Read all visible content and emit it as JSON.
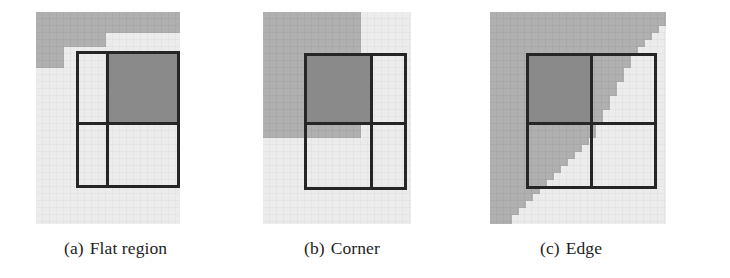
{
  "figure": {
    "name": "neighbourhood-classification-figure",
    "background_color": "#ffffff",
    "panel_count": 3
  },
  "colors": {
    "paper": "#ffffff",
    "light_region": "#ececec",
    "light_region_grid": "#e0e0e0",
    "gray_region": "#b0b0b0",
    "gray_region_grid": "#a6a6a6",
    "dark_quadrant": "#8a8a8a",
    "box_stroke": "#262626",
    "caption_text": "#1d1d1d"
  },
  "panels": [
    {
      "id": "a",
      "tag": "(a)",
      "label": "Flat region",
      "caption": "(a) Flat region",
      "feature": "flat",
      "description": "Uniform light region under the 2x2 window; gray region lies above and does not cut the window.",
      "highlighted_quadrant": "top-right",
      "cell_size": 7,
      "image_size": [
        144,
        212
      ],
      "region_shape": "horizontal band across the top with a small step on the left"
    },
    {
      "id": "b",
      "tag": "(b)",
      "label": "Corner",
      "caption": "(b) Corner",
      "feature": "corner",
      "description": "Gray region forms an L-shaped corner meeting inside the 2x2 window.",
      "highlighted_quadrant": "top-left",
      "cell_size": 7,
      "image_size": [
        148,
        212
      ],
      "region_shape": "rectangular corner occupying upper-left, boundary turns ninety degrees"
    },
    {
      "id": "c",
      "tag": "(c)",
      "label": "Edge",
      "caption": "(c) Edge",
      "feature": "edge",
      "description": "Gray region bounded by a staircase diagonal running from upper-right to lower-left.",
      "highlighted_quadrant": "top-left",
      "cell_size": 7,
      "image_size": [
        176,
        212
      ],
      "region_shape": "anti-diagonal staircase edge"
    }
  ],
  "box": {
    "name": "2x2 sampling window",
    "rows": 2,
    "columns": 2,
    "stroke_width": 3
  }
}
